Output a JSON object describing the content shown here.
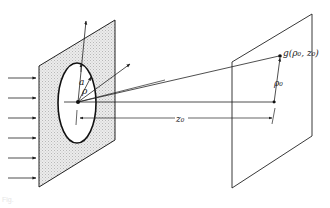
{
  "diagram": {
    "labels": {
      "aperture_radius": "a",
      "aperture_coordinate": "ρ",
      "observation_point": "g(ρ₀, z₀)",
      "observation_radius": "ρ₀",
      "propagation_distance": "z₀"
    },
    "caption": "Fig.",
    "incident_arrows_count": 6,
    "colors": {
      "line": "#222222",
      "hatch_fill": "#d9d9d9",
      "background": "#ffffff"
    }
  }
}
